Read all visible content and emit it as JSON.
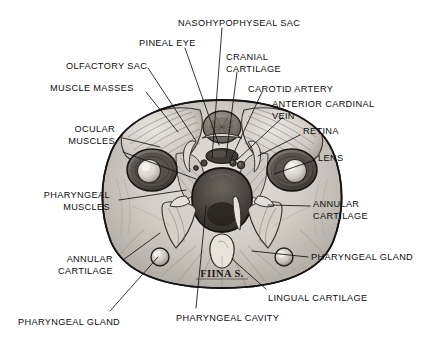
{
  "figure": {
    "kind": "anatomical-illustration",
    "medium": "pencil drawing",
    "signature": "FIINA S.",
    "colors": {
      "background": "#ffffff",
      "ink": "#0d0d0d",
      "leader_line": "#111111",
      "tissue_light": "#dcd8d2",
      "tissue_mid": "#b2ada6",
      "tissue_dark": "#6e6963",
      "cavity_dark": "#4a453f",
      "outline": "#1a1a1a"
    }
  },
  "labels": [
    {
      "id": "nasohypophyseal-sac",
      "text": "NASOHYPOPHYSEAL SAC",
      "align": "left",
      "x": 178,
      "y": 18,
      "lines": [
        "NASOHYPOPHYSEAL SAC"
      ]
    },
    {
      "id": "pineal-eye",
      "text": "PINEAL EYE",
      "align": "left",
      "x": 139,
      "y": 38,
      "lines": [
        "PINEAL EYE"
      ]
    },
    {
      "id": "cranial-cartilage",
      "text": "CRANIAL CARTILAGE",
      "align": "left",
      "x": 226,
      "y": 52,
      "lines": [
        "CRANIAL",
        "CARTILAGE"
      ]
    },
    {
      "id": "olfactory-sac",
      "text": "OLFACTORY SAC",
      "align": "left",
      "x": 66,
      "y": 61,
      "lines": [
        "OLFACTORY SAC"
      ]
    },
    {
      "id": "carotid-artery",
      "text": "CAROTID ARTERY",
      "align": "left",
      "x": 248,
      "y": 84,
      "lines": [
        "CAROTID ARTERY"
      ]
    },
    {
      "id": "muscle-masses",
      "text": "MUSCLE MASSES",
      "align": "left",
      "x": 50,
      "y": 83,
      "lines": [
        "MUSCLE MASSES"
      ]
    },
    {
      "id": "anterior-cardinal-vein",
      "text": "ANTERIOR CARDINAL VEIN",
      "align": "left",
      "x": 272,
      "y": 99,
      "lines": [
        "ANTERIOR CARDINAL",
        "VEIN"
      ]
    },
    {
      "id": "ocular-muscles",
      "text": "OCULAR MUSCLES",
      "align": "right",
      "x": 115,
      "y": 124,
      "lines": [
        "OCULAR",
        "MUSCLES"
      ]
    },
    {
      "id": "retina",
      "text": "RETINA",
      "align": "left",
      "x": 303,
      "y": 126,
      "lines": [
        "RETINA"
      ]
    },
    {
      "id": "lens",
      "text": "LENS",
      "align": "left",
      "x": 318,
      "y": 153,
      "lines": [
        "LENS"
      ]
    },
    {
      "id": "pharyngeal-muscles",
      "text": "PHARYNGEAL MUSCLES",
      "align": "right",
      "x": 110,
      "y": 190,
      "lines": [
        "PHARYNGEAL",
        "MUSCLES"
      ]
    },
    {
      "id": "annular-cartilage-right",
      "text": "ANNULAR CARTILAGE",
      "align": "left",
      "x": 313,
      "y": 199,
      "lines": [
        "ANNULAR",
        "CARTILAGE"
      ]
    },
    {
      "id": "annular-cartilage-left",
      "text": "ANNULAR CARTILAGE",
      "align": "right",
      "x": 113,
      "y": 254,
      "lines": [
        "ANNULAR",
        "CARTILAGE"
      ]
    },
    {
      "id": "pharyngeal-gland-right",
      "text": "PHARYNGEAL GLAND",
      "align": "left",
      "x": 311,
      "y": 252,
      "lines": [
        "PHARYNGEAL GLAND"
      ]
    },
    {
      "id": "lingual-cartilage",
      "text": "LINGUAL CARTILAGE",
      "align": "left",
      "x": 268,
      "y": 293,
      "lines": [
        "LINGUAL CARTILAGE"
      ]
    },
    {
      "id": "pharyngeal-cavity",
      "text": "PHARYNGEAL CAVITY",
      "align": "left",
      "x": 176,
      "y": 313,
      "lines": [
        "PHARYNGEAL CAVITY"
      ]
    },
    {
      "id": "pharyngeal-gland-left",
      "text": "PHARYNGEAL GLAND",
      "align": "left",
      "x": 18,
      "y": 317,
      "lines": [
        "PHARYNGEAL GLAND"
      ]
    }
  ],
  "leaders": [
    {
      "id": "leader-nasohypophyseal-sac",
      "from": [
        222,
        28
      ],
      "to": [
        212,
        158
      ]
    },
    {
      "id": "leader-pineal-eye",
      "from": [
        185,
        48
      ],
      "to": [
        219,
        145
      ]
    },
    {
      "id": "leader-cranial-cartilage",
      "from": [
        237,
        72
      ],
      "to": [
        226,
        157
      ]
    },
    {
      "id": "leader-olfactory-sac",
      "from": [
        148,
        68
      ],
      "to": [
        196,
        141
      ]
    },
    {
      "id": "leader-carotid-artery",
      "from": [
        262,
        92
      ],
      "to": [
        231,
        159
      ]
    },
    {
      "id": "leader-muscle-masses",
      "from": [
        146,
        92
      ],
      "to": [
        178,
        132
      ]
    },
    {
      "id": "leader-anterior-cardinal-vein",
      "from": [
        283,
        117
      ],
      "to": [
        237,
        160
      ]
    },
    {
      "id": "leader-ocular-muscles",
      "from": [
        123,
        138
      ],
      "to": [
        160,
        147
      ]
    },
    {
      "id": "leader-ocular-muscles-2",
      "from": [
        123,
        152
      ],
      "to": [
        196,
        179
      ]
    },
    {
      "id": "leader-retina",
      "from": [
        300,
        135
      ],
      "to": [
        258,
        156
      ]
    },
    {
      "id": "leader-lens",
      "from": [
        315,
        160
      ],
      "to": [
        274,
        174
      ]
    },
    {
      "id": "leader-pharyngeal-muscles",
      "from": [
        119,
        200
      ],
      "to": [
        186,
        190
      ]
    },
    {
      "id": "leader-annular-cartilage-right",
      "from": [
        310,
        206
      ],
      "to": [
        268,
        205
      ]
    },
    {
      "id": "leader-annular-cartilage-left",
      "from": [
        123,
        260
      ],
      "to": [
        160,
        233
      ]
    },
    {
      "id": "leader-pharyngeal-gland-right",
      "from": [
        308,
        257
      ],
      "to": [
        252,
        251
      ]
    },
    {
      "id": "leader-lingual-cartilage",
      "from": [
        266,
        289
      ],
      "to": [
        232,
        259
      ]
    },
    {
      "id": "leader-pharyngeal-cavity",
      "from": [
        196,
        308
      ],
      "to": [
        206,
        206
      ]
    },
    {
      "id": "leader-pharyngeal-gland-left",
      "from": [
        110,
        311
      ],
      "to": [
        158,
        257
      ]
    }
  ]
}
